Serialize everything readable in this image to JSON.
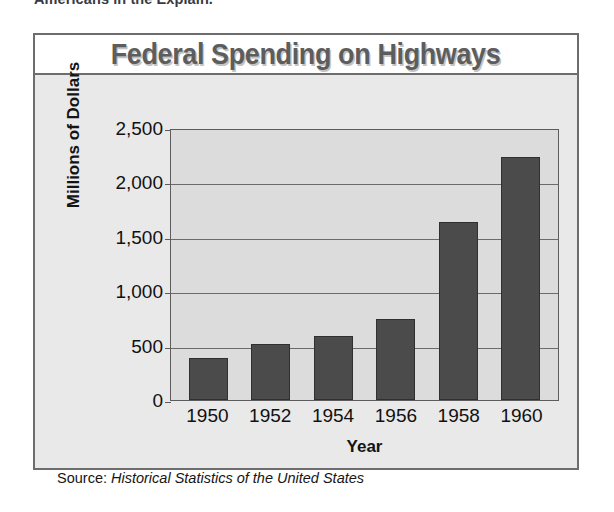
{
  "clipped_header_text": "Americans in the  Explain.",
  "chart_data": {
    "type": "bar",
    "title": "Federal Spending on Highways",
    "xlabel": "Year",
    "ylabel": "Millions of Dollars",
    "categories": [
      "1950",
      "1952",
      "1954",
      "1956",
      "1958",
      "1960"
    ],
    "values": [
      385,
      520,
      590,
      750,
      1650,
      2250
    ],
    "ylim": [
      0,
      2500
    ],
    "yticks": [
      0,
      500,
      1000,
      1500,
      2000,
      2500
    ],
    "ytick_labels": [
      "0",
      "500",
      "1,000",
      "1,500",
      "2,000",
      "2,500"
    ],
    "grid": true,
    "legend": "none",
    "bar_color": "#4b4b4b",
    "plot_background": "#dcdcdc",
    "figure_background": "#e9e9e9",
    "title_color": "#5d5d5d",
    "source_label": "Source:",
    "source_value": "Historical Statistics of the United States"
  }
}
